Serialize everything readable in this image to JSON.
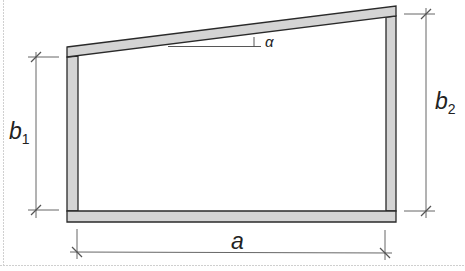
{
  "diagram": {
    "type": "frame-cross-section",
    "colors": {
      "member_fill": "#d4d4d4",
      "member_stroke": "#2a2a2a",
      "dimension_line": "#555555",
      "border": "#cfcfcf",
      "text": "#222222"
    },
    "labels": {
      "width": "a",
      "left_height_base": "b",
      "left_height_sub": "1",
      "right_height_base": "b",
      "right_height_sub": "2",
      "angle": "α"
    }
  }
}
